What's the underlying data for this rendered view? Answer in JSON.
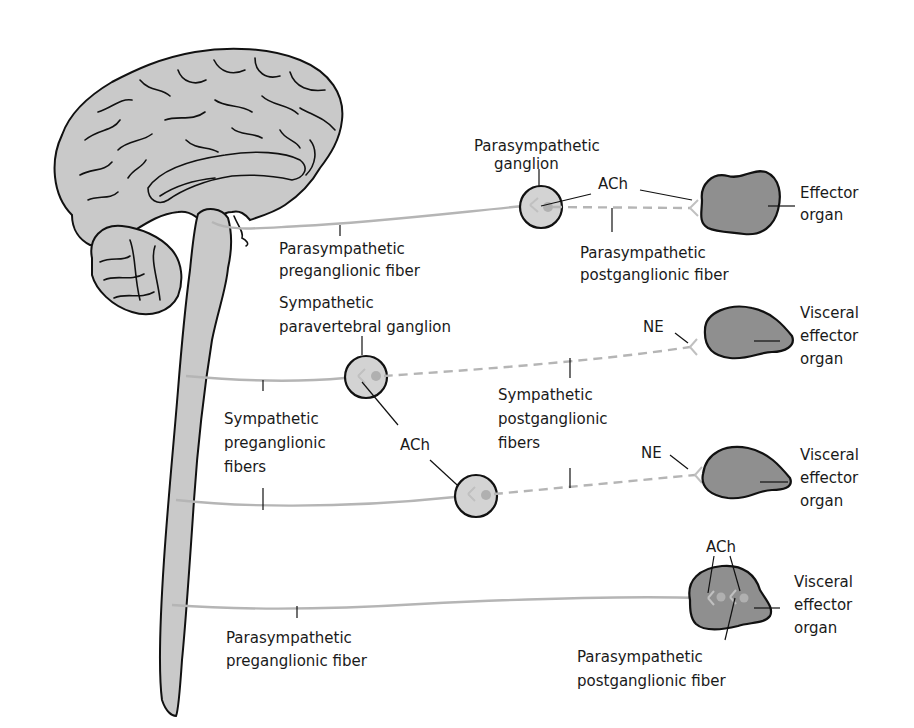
{
  "diagram": {
    "colors": {
      "background": "#ffffff",
      "brain_fill": "#c9c9c9",
      "ganglion_fill": "#d3d3d3",
      "organ_fill": "#8f8f8f",
      "fiber": "#b5b5b5",
      "outline": "#111111"
    },
    "labels": {
      "para_ganglion": [
        "Parasympathetic",
        "ganglion"
      ],
      "ach_top": "ACh",
      "effector_top": [
        "Effector",
        "organ"
      ],
      "para_pre_top": [
        "Parasympathetic",
        "preganglionic fiber"
      ],
      "para_post_top": [
        "Parasympathetic",
        "postganglionic fiber"
      ],
      "symp_paravertebral": [
        "Sympathetic",
        "paravertebral  ganglion"
      ],
      "ne_1": "NE",
      "visceral_1": [
        "Visceral",
        "effector",
        "organ"
      ],
      "symp_pre": [
        "Sympathetic",
        "preganglionic",
        "fibers"
      ],
      "ach_middle": "ACh",
      "symp_post": [
        "Sympathetic",
        "postganglionic",
        "fibers"
      ],
      "ne_2": "NE",
      "visceral_2": [
        "Visceral",
        "effector",
        "organ"
      ],
      "ach_bottom": "ACh",
      "visceral_3": [
        "Visceral",
        "effector",
        "organ"
      ],
      "para_pre_bottom": [
        "Parasympathetic",
        "preganglionic fiber"
      ],
      "para_post_bottom": [
        "Parasympathetic",
        "postganglionic fiber"
      ]
    },
    "pathways": [
      {
        "name": "cranial parasympathetic",
        "neurotransmitters": [
          "ACh",
          "ACh"
        ],
        "target": "Effector organ"
      },
      {
        "name": "sympathetic (paravertebral)",
        "neurotransmitters": [
          "ACh",
          "NE"
        ],
        "target": "Visceral effector organ"
      },
      {
        "name": "sympathetic (second ganglion)",
        "neurotransmitters": [
          "ACh",
          "NE"
        ],
        "target": "Visceral effector organ"
      },
      {
        "name": "sacral parasympathetic (intramural ganglion)",
        "neurotransmitters": [
          "ACh",
          "ACh"
        ],
        "target": "Visceral effector organ"
      }
    ]
  }
}
